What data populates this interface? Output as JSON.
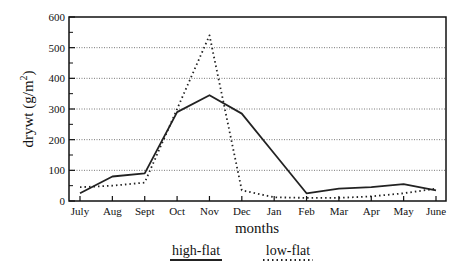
{
  "chart_data": {
    "type": "line",
    "title": "",
    "xlabel": "months",
    "ylabel": "drywt (g/m²)",
    "ylabel_parts": {
      "main": "drywt (g/m",
      "sup": "2",
      "close": ")"
    },
    "categories": [
      "July",
      "Aug",
      "Sept",
      "Oct",
      "Nov",
      "Dec",
      "Jan",
      "Feb",
      "Mar",
      "Apr",
      "May",
      "June"
    ],
    "yticks": [
      0,
      100,
      200,
      300,
      400,
      500,
      600
    ],
    "ylim": [
      0,
      600
    ],
    "grid": "horizontal dotted",
    "legend_position": "bottom",
    "series": [
      {
        "name": "high-flat",
        "style": "solid",
        "color": "#222222",
        "values": [
          25,
          80,
          90,
          290,
          345,
          285,
          155,
          25,
          40,
          45,
          55,
          35
        ]
      },
      {
        "name": "low-flat",
        "style": "dotted",
        "color": "#222222",
        "values": [
          45,
          50,
          60,
          300,
          540,
          35,
          12,
          10,
          10,
          15,
          25,
          40
        ]
      }
    ]
  }
}
